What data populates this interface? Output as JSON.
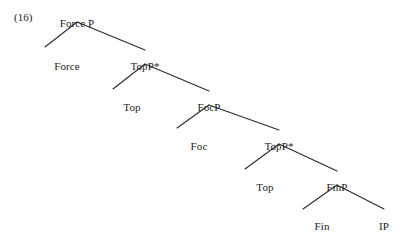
{
  "figure": {
    "example_number": "(16)",
    "type": "syntax-tree",
    "ink_color": "#2b2b2b",
    "background_color": "#ffffff",
    "nodes": [
      {
        "id": "forcep",
        "label": "Force P",
        "x": 77,
        "y": 17,
        "role": "root-phrase"
      },
      {
        "id": "force",
        "label": "Force",
        "x": 67,
        "y": 60,
        "role": "head-leaf"
      },
      {
        "id": "topp1",
        "label": "TopP*",
        "x": 145,
        "y": 60,
        "role": "phrase"
      },
      {
        "id": "top1",
        "label": "Top",
        "x": 132,
        "y": 101,
        "role": "head-leaf"
      },
      {
        "id": "focp",
        "label": "FocP",
        "x": 209,
        "y": 101,
        "role": "phrase"
      },
      {
        "id": "foc",
        "label": "Foc",
        "x": 199,
        "y": 140,
        "role": "head-leaf"
      },
      {
        "id": "topp2",
        "label": "TopP*",
        "x": 279,
        "y": 140,
        "role": "phrase"
      },
      {
        "id": "top2",
        "label": "Top",
        "x": 265,
        "y": 181,
        "role": "head-leaf"
      },
      {
        "id": "finp",
        "label": "FinP",
        "x": 337,
        "y": 181,
        "role": "phrase"
      },
      {
        "id": "fin",
        "label": "Fin",
        "x": 322,
        "y": 220,
        "role": "head-leaf"
      },
      {
        "id": "ip",
        "label": "IP",
        "x": 384,
        "y": 220,
        "role": "phrase-leaf"
      }
    ],
    "branches": [
      {
        "from": "forcep",
        "to": "force",
        "x1": 77,
        "y1": 22,
        "x2": 45,
        "y2": 47
      },
      {
        "from": "forcep",
        "to": "topp1",
        "x1": 77,
        "y1": 22,
        "x2": 145,
        "y2": 50
      },
      {
        "from": "topp1",
        "to": "top1",
        "x1": 145,
        "y1": 64,
        "x2": 113,
        "y2": 89
      },
      {
        "from": "topp1",
        "to": "focp",
        "x1": 145,
        "y1": 64,
        "x2": 209,
        "y2": 91
      },
      {
        "from": "focp",
        "to": "foc",
        "x1": 209,
        "y1": 105,
        "x2": 177,
        "y2": 128
      },
      {
        "from": "focp",
        "to": "topp2",
        "x1": 209,
        "y1": 105,
        "x2": 279,
        "y2": 130
      },
      {
        "from": "topp2",
        "to": "top2",
        "x1": 279,
        "y1": 144,
        "x2": 245,
        "y2": 169
      },
      {
        "from": "topp2",
        "to": "finp",
        "x1": 279,
        "y1": 144,
        "x2": 337,
        "y2": 171
      },
      {
        "from": "finp",
        "to": "fin",
        "x1": 337,
        "y1": 185,
        "x2": 303,
        "y2": 209
      },
      {
        "from": "finp",
        "to": "ip",
        "x1": 337,
        "y1": 185,
        "x2": 384,
        "y2": 209
      }
    ]
  }
}
